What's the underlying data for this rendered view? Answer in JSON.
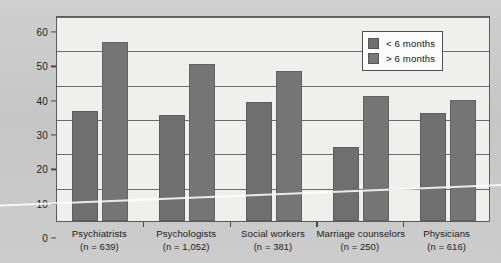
{
  "chart_data": {
    "type": "bar",
    "title": "",
    "xlabel": "",
    "ylabel": "% Major improvement",
    "ylim": [
      0,
      60
    ],
    "yticks": [
      0,
      10,
      20,
      30,
      40,
      50,
      60
    ],
    "grid": true,
    "legend_position": "top-right",
    "categories": [
      "Psychiatrists",
      "Psychologists",
      "Social workers",
      "Marriage counselors",
      "Physicians"
    ],
    "category_counts": [
      "(n = 639)",
      "(n = 1,052)",
      "(n = 381)",
      "(n = 250)",
      "(n = 616)"
    ],
    "series": [
      {
        "name": "< 6 months",
        "color": "#6f6f6f",
        "values": [
          32,
          30.8,
          34.6,
          21.5,
          31.5
        ]
      },
      {
        "name": "> 6 months",
        "color": "#757575",
        "values": [
          52,
          45.7,
          43.6,
          36.5,
          35.2
        ]
      }
    ]
  },
  "legend": {
    "items": [
      {
        "label": "< 6 months"
      },
      {
        "label": "> 6 months"
      }
    ]
  },
  "colors": {
    "page_background": "#c9c9c9",
    "plot_background": "#efefee",
    "gridline": "#6b6b6b",
    "axis": "#4a4a4a",
    "series_a": "#6f6f6f",
    "series_b": "#757575"
  }
}
